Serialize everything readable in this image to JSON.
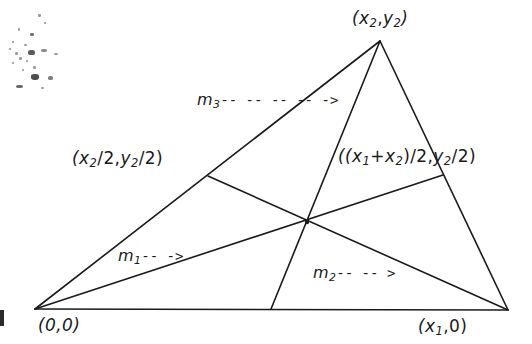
{
  "figure": {
    "type": "geometry-diagram",
    "background_color": "#ffffff",
    "line_color": "#1a1a1a",
    "text_color": "#1a1a1a"
  },
  "labels": {
    "apex": "(x2,y2)",
    "apex_parts": {
      "open": "(",
      "x": "x",
      "xsub": "2",
      "comma": ",",
      "y": "y",
      "ysub": "2",
      "close": ")"
    },
    "mid_left": "(x2/2,y2/2)",
    "mid_right": "((x1+x2)/2,y2/2)",
    "origin": "(0,0)",
    "vertex_x1": "(x1,0)",
    "m1": "m1",
    "m2": "m2",
    "m3": "m3",
    "m1_arrow": "-- ->",
    "m2_arrow": "-- -- >",
    "m3_arrow": "-- -- -- -- ->"
  },
  "geometry": {
    "vertices": {
      "origin": [
        35,
        309
      ],
      "vertex_x1": [
        508,
        310
      ],
      "apex": [
        380,
        41
      ]
    },
    "midpoints": {
      "left_side": [
        208,
        176
      ],
      "right_side": [
        443,
        175
      ],
      "base": [
        271,
        309
      ]
    },
    "centroid": [
      307,
      222
    ],
    "medians": [
      {
        "name": "m1",
        "from": "origin",
        "to": "right_side"
      },
      {
        "name": "m2",
        "from": "vertex_x1",
        "to": "left_side"
      },
      {
        "name": "m3",
        "from": "apex",
        "to": "base"
      }
    ]
  }
}
